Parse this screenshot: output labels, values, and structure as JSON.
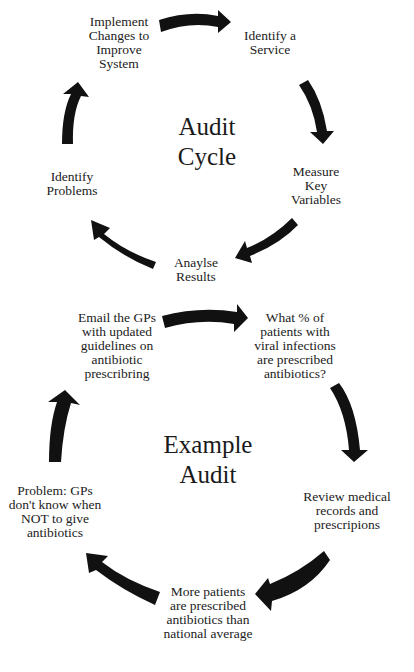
{
  "diagram": {
    "audit_cycle": {
      "title": "Audit\nCycle",
      "steps": [
        {
          "id": "identify-service",
          "label": "Identify a\nService"
        },
        {
          "id": "measure-key-variables",
          "label": "Measure\nKey\nVariables"
        },
        {
          "id": "analyse-results",
          "label": "Anaylse\nResults"
        },
        {
          "id": "identify-problems",
          "label": "Identify\nProblems"
        },
        {
          "id": "implement-changes",
          "label": "Implement\nChanges to\nImprove\nSystem"
        }
      ]
    },
    "example_audit": {
      "title": "Example\nAudit",
      "steps": [
        {
          "id": "what-percent",
          "label": "What % of\npatients with\nviral infections\nare prescribed\nantibiotics?"
        },
        {
          "id": "review-records",
          "label": "Review medical\nrecords and\nprescripions"
        },
        {
          "id": "more-patients",
          "label": "More patients\nare prescribed\nantibiotics than\nnational average"
        },
        {
          "id": "problem-gps",
          "label": "Problem: GPs\ndon't know when\nNOT to give\nantibiotics"
        },
        {
          "id": "email-gps",
          "label": "Email the GPs\nwith updated\nguidelines on\nantibiotic\nprescribring"
        }
      ]
    },
    "colors": {
      "arrow": "#111111",
      "text": "#222222",
      "background": "#ffffff"
    }
  }
}
